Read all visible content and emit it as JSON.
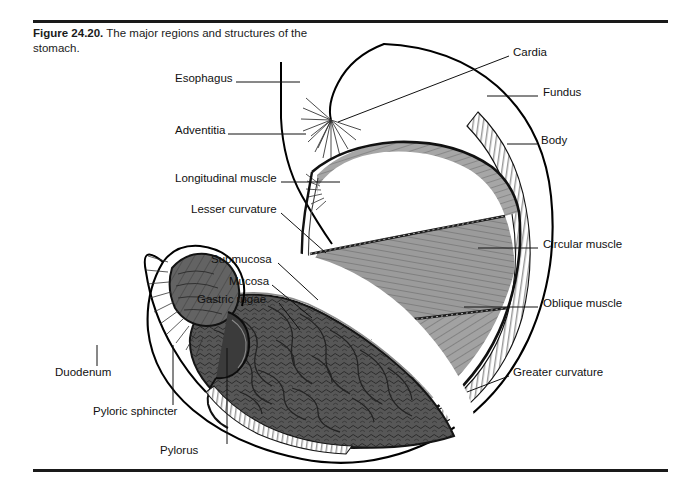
{
  "figure": {
    "number": "Figure 24.20.",
    "caption": "The major regions and structures of the stomach.",
    "title_full": "Figure 24.20. The major regions and structures of the stomach."
  },
  "colors": {
    "background": "#ffffff",
    "ink": "#111111",
    "rule": "#1a1a1a",
    "muscle_light": "#a8a8a8",
    "muscle_mid": "#969696",
    "muscle_dark": "#7d7d7d",
    "lumen_dark": "#5d5d5d",
    "rugae_dark": "#4a4a4a",
    "rugae_deep": "#2e2e2e",
    "serosa_white": "#ffffff",
    "outline": "#000000"
  },
  "labels_left": [
    {
      "id": "esophagus",
      "text": "Esophagus",
      "x": 175,
      "y": 78,
      "leader": "horizontal"
    },
    {
      "id": "adventitia",
      "text": "Adventitia",
      "x": 175,
      "y": 130,
      "leader": "horizontal"
    },
    {
      "id": "longitudinal-muscle",
      "text": "Longitudinal muscle",
      "x": 175,
      "y": 178,
      "leader": "horizontal"
    },
    {
      "id": "lesser-curvature",
      "text": "Lesser curvature",
      "x": 191,
      "y": 209,
      "leader": "diagonal"
    },
    {
      "id": "submucosa",
      "text": "Submucosa",
      "x": 211,
      "y": 259,
      "leader": "diagonal"
    },
    {
      "id": "mucosa",
      "text": "Mucosa",
      "x": 229,
      "y": 281,
      "leader": "diagonal"
    },
    {
      "id": "gastric-rugae",
      "text": "Gastric rugae",
      "x": 197,
      "y": 299,
      "leader": "diagonal"
    }
  ],
  "labels_right": [
    {
      "id": "cardia",
      "text": "Cardia",
      "x": 513,
      "y": 52,
      "leader": "diagonal"
    },
    {
      "id": "fundus",
      "text": "Fundus",
      "x": 543,
      "y": 92,
      "leader": "horizontal"
    },
    {
      "id": "body",
      "text": "Body",
      "x": 541,
      "y": 140,
      "leader": "horizontal"
    },
    {
      "id": "circular-muscle",
      "text": "Circular muscle",
      "x": 543,
      "y": 244,
      "leader": "horizontal"
    },
    {
      "id": "oblique-muscle",
      "text": "Oblique muscle",
      "x": 543,
      "y": 303,
      "leader": "horizontal"
    },
    {
      "id": "greater-curvature",
      "text": "Greater curvature",
      "x": 513,
      "y": 372,
      "leader": "diagonal"
    }
  ],
  "labels_bottom": [
    {
      "id": "duodenum",
      "text": "Duodenum",
      "x": 55,
      "y": 372,
      "leader": "vertical"
    },
    {
      "id": "pyloric-sphincter",
      "text": "Pyloric sphincter",
      "x": 93,
      "y": 411,
      "leader": "vertical"
    },
    {
      "id": "pylorus",
      "text": "Pylorus",
      "x": 160,
      "y": 450,
      "leader": "vertical"
    }
  ],
  "anatomy_parts": [
    "esophagus",
    "cardia",
    "fundus",
    "body",
    "pylorus",
    "pyloric sphincter",
    "duodenum",
    "lesser curvature",
    "greater curvature",
    "longitudinal muscle",
    "circular muscle",
    "oblique muscle",
    "adventitia",
    "submucosa",
    "mucosa",
    "gastric rugae"
  ]
}
